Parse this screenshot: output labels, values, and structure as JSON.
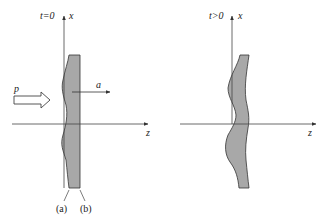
{
  "colors": {
    "slab_fill": "#a8a8a8",
    "line": "#333333",
    "background": "#ffffff"
  },
  "left_panel": {
    "time_label": "t=0",
    "x_axis_label": "x",
    "z_axis_label": "z",
    "pressure_label": "p",
    "acceleration_label": "a",
    "surface_a_label": "(a)",
    "surface_b_label": "(b)"
  },
  "right_panel": {
    "time_label": "t>0",
    "x_axis_label": "x",
    "z_axis_label": "z"
  }
}
